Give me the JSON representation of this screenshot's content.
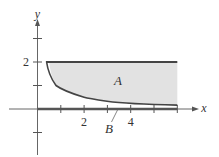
{
  "figure": {
    "axes": {
      "x_label": "x",
      "y_label": "y",
      "x_ticks": [
        1,
        2,
        3,
        4,
        5,
        6
      ],
      "x_tick_labels": {
        "2": "2",
        "4": "4"
      },
      "y_ticks": [
        -1,
        1,
        2,
        3
      ],
      "y_tick_labels": {
        "2": "2"
      }
    },
    "curves": {
      "lower_boundary": "y = 1/x",
      "upper_boundary": "y = 2",
      "x_start": 0.5,
      "x_end": 6
    },
    "regions": {
      "A": {
        "label": "A",
        "fill": "#e2e2e2",
        "description": "shaded region between y = 1/x and y = 2"
      },
      "B": {
        "label": "B",
        "description": "thick segment along x-axis under curve"
      }
    },
    "labels": {
      "tick_2_x": "2",
      "tick_4_x": "4",
      "tick_2_y": "2",
      "region_a": "A",
      "region_b": "B",
      "x_axis": "x",
      "y_axis": "y"
    },
    "colors": {
      "axis": "#555555",
      "boundary": "#444444",
      "fill": "#e2e2e2"
    }
  }
}
